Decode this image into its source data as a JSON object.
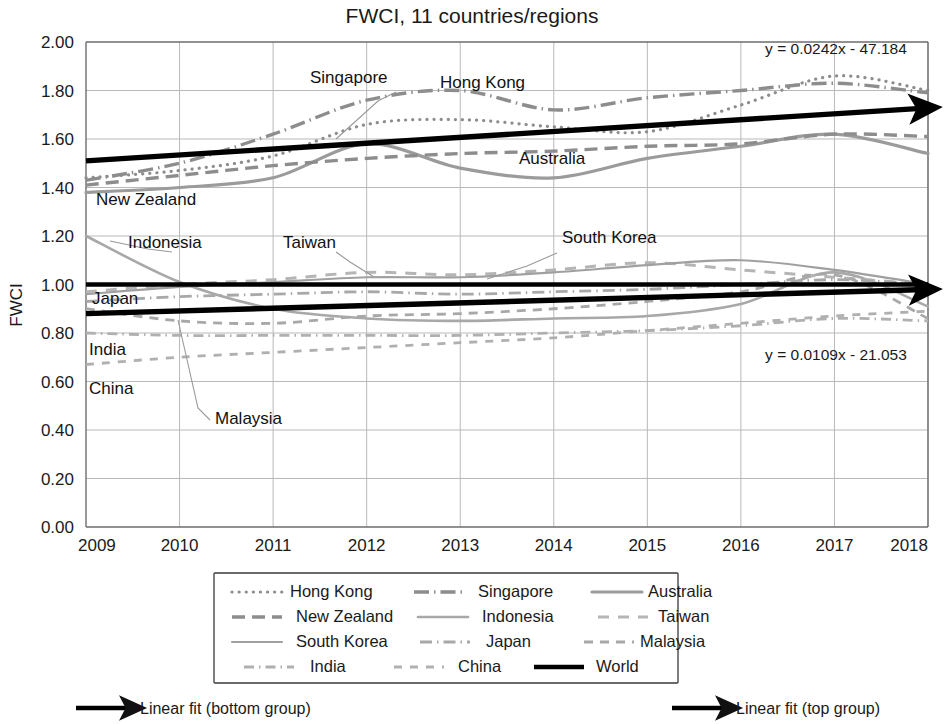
{
  "chart_data": {
    "type": "line",
    "title": "FWCI, 11 countries/regions",
    "xlabel": "",
    "ylabel": "FWCI",
    "x": [
      2009,
      2010,
      2011,
      2012,
      2013,
      2014,
      2015,
      2016,
      2017,
      2018
    ],
    "xlim": [
      2009,
      2018
    ],
    "ylim": [
      0.0,
      2.0
    ],
    "ytick_labels": [
      "0.00",
      "0.20",
      "0.40",
      "0.60",
      "0.80",
      "1.00",
      "1.20",
      "1.40",
      "1.60",
      "1.80",
      "2.00"
    ],
    "ytick_values": [
      0.0,
      0.2,
      0.4,
      0.6,
      0.8,
      1.0,
      1.2,
      1.4,
      1.6,
      1.8,
      2.0
    ],
    "xtick_labels": [
      "2009",
      "2010",
      "2011",
      "2012",
      "2013",
      "2014",
      "2015",
      "2016",
      "2017",
      "2018"
    ],
    "grid": true,
    "legend_position": "bottom",
    "series": [
      {
        "name": "Hong Kong",
        "style": "dotted",
        "color": "#8d8d8d",
        "values": [
          1.44,
          1.47,
          1.53,
          1.66,
          1.68,
          1.65,
          1.63,
          1.74,
          1.86,
          1.8
        ]
      },
      {
        "name": "Singapore",
        "style": "dash-dot",
        "color": "#8d8d8d",
        "values": [
          1.43,
          1.5,
          1.62,
          1.76,
          1.8,
          1.72,
          1.77,
          1.8,
          1.83,
          1.79
        ]
      },
      {
        "name": "Australia",
        "style": "solid",
        "color": "#9b9b9b",
        "values": [
          1.38,
          1.4,
          1.44,
          1.58,
          1.48,
          1.44,
          1.52,
          1.57,
          1.62,
          1.54
        ]
      },
      {
        "name": "New Zealand",
        "style": "dashed",
        "color": "#8d8d8d",
        "values": [
          1.41,
          1.45,
          1.49,
          1.52,
          1.54,
          1.55,
          1.57,
          1.58,
          1.62,
          1.61
        ]
      },
      {
        "name": "Indonesia",
        "style": "solid-light",
        "color": "#a8a8a8",
        "values": [
          1.2,
          1.01,
          0.9,
          0.86,
          0.85,
          0.86,
          0.87,
          0.92,
          1.05,
          0.91
        ]
      },
      {
        "name": "Taiwan",
        "style": "long-dash",
        "color": "#b5b5b5",
        "values": [
          0.97,
          1.0,
          1.02,
          1.05,
          1.04,
          1.06,
          1.09,
          1.06,
          1.03,
          1.0
        ]
      },
      {
        "name": "South Korea",
        "style": "solid-thin",
        "color": "#a0a0a0",
        "values": [
          0.96,
          0.99,
          1.01,
          1.03,
          1.03,
          1.05,
          1.08,
          1.1,
          1.06,
          1.0
        ]
      },
      {
        "name": "Japan",
        "style": "dash-dot2",
        "color": "#a8a8a8",
        "values": [
          0.93,
          0.95,
          0.96,
          0.97,
          0.96,
          0.97,
          0.98,
          1.0,
          1.02,
          1.0
        ]
      },
      {
        "name": "Malaysia",
        "style": "short-dash",
        "color": "#a8a8a8",
        "values": [
          0.9,
          0.85,
          0.84,
          0.87,
          0.88,
          0.9,
          0.93,
          0.97,
          1.04,
          0.86
        ]
      },
      {
        "name": "India",
        "style": "dot-dash",
        "color": "#b0b0b0",
        "values": [
          0.8,
          0.79,
          0.79,
          0.79,
          0.79,
          0.8,
          0.81,
          0.83,
          0.86,
          0.85
        ]
      },
      {
        "name": "China",
        "style": "dashed-wide",
        "color": "#b0b0b0",
        "values": [
          0.67,
          0.7,
          0.72,
          0.74,
          0.76,
          0.78,
          0.81,
          0.84,
          0.87,
          0.89
        ]
      },
      {
        "name": "World",
        "style": "black-solid",
        "color": "#000000",
        "values": [
          1.0,
          1.0,
          1.0,
          1.0,
          1.0,
          1.0,
          1.0,
          1.0,
          1.0,
          1.0
        ]
      }
    ],
    "trendlines": [
      {
        "name": "Linear fit (top group)",
        "equation": "y = 0.0242x - 47.184",
        "start": [
          2009,
          1.51
        ],
        "end": [
          2018,
          1.73
        ]
      },
      {
        "name": "Linear fit (bottom group)",
        "equation": "y = 0.0109x - 21.053",
        "start": [
          2009,
          0.88
        ],
        "end": [
          2018,
          0.98
        ]
      }
    ],
    "annotations": [
      {
        "label": "Singapore",
        "x": 310,
        "y": 83
      },
      {
        "label": "Hong Kong",
        "x": 440,
        "y": 88
      },
      {
        "label": "Australia",
        "x": 519,
        "y": 164
      },
      {
        "label": "New Zealand",
        "x": 96,
        "y": 205
      },
      {
        "label": "Indonesia",
        "x": 128,
        "y": 248
      },
      {
        "label": "Taiwan",
        "x": 283,
        "y": 248
      },
      {
        "label": "South Korea",
        "x": 562,
        "y": 243
      },
      {
        "label": "Japan",
        "x": 92,
        "y": 304
      },
      {
        "label": "India",
        "x": 89,
        "y": 355
      },
      {
        "label": "China",
        "x": 89,
        "y": 394
      },
      {
        "label": "Malaysia",
        "x": 215,
        "y": 424
      }
    ]
  },
  "footer": {
    "bottom_fit_label": "Linear fit (bottom group)",
    "top_fit_label": "Linear fit (top group)"
  }
}
